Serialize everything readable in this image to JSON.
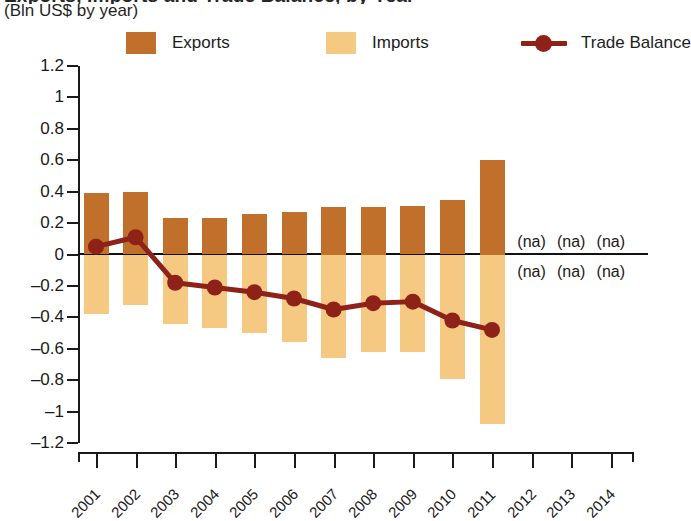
{
  "header": {
    "title": "Exports, Imports and Trade Balance, by Year",
    "subtitle": "(Bln US$ by year)"
  },
  "legend": {
    "items": [
      {
        "label": "Exports",
        "type": "swatch",
        "color": "#C0702A"
      },
      {
        "label": "Imports",
        "type": "swatch",
        "color": "#F6C983"
      },
      {
        "label": "Trade Balance",
        "type": "line-marker",
        "color": "#8E2218"
      }
    ]
  },
  "axes": {
    "y_ticks": [
      "1.2",
      "1",
      "0.8",
      "0.6",
      "0.4",
      "0.2",
      "0",
      "-0.2",
      "-0.4",
      "-0.6",
      "-0.8",
      "-1",
      "-1.2"
    ],
    "y_min": -1.2,
    "y_max": 1.2,
    "x_labels": [
      "2001",
      "2002",
      "2003",
      "2004",
      "2005",
      "2006",
      "2007",
      "2008",
      "2009",
      "2010",
      "2011",
      "2012",
      "2013",
      "2014"
    ]
  },
  "annotations": {
    "na_label": "(na)",
    "na_years": [
      "2012",
      "2013",
      "2014"
    ],
    "na_rows": [
      "exports",
      "imports"
    ]
  },
  "chart_data": {
    "type": "bar",
    "title": "Exports, Imports and Trade Balance, by Year",
    "subtitle": "(Bln US$ by year)",
    "xlabel": "",
    "ylabel": "Bln US$ by year",
    "ylim": [
      -1.2,
      1.2
    ],
    "grid": false,
    "legend_position": "top",
    "categories": [
      "2001",
      "2002",
      "2003",
      "2004",
      "2005",
      "2006",
      "2007",
      "2008",
      "2009",
      "2010",
      "2011",
      "2012",
      "2013",
      "2014"
    ],
    "series": [
      {
        "name": "Exports",
        "type": "bar",
        "color": "#C0702A",
        "values": [
          0.39,
          0.4,
          0.23,
          0.23,
          0.26,
          0.27,
          0.3,
          0.3,
          0.31,
          0.35,
          0.6,
          null,
          null,
          null
        ]
      },
      {
        "name": "Imports",
        "type": "bar",
        "color": "#F6C983",
        "values": [
          -0.38,
          -0.32,
          -0.44,
          -0.47,
          -0.5,
          -0.56,
          -0.66,
          -0.62,
          -0.62,
          -0.79,
          -1.08,
          null,
          null,
          null
        ]
      },
      {
        "name": "Trade Balance",
        "type": "line",
        "color": "#8E2218",
        "values": [
          0.05,
          0.11,
          -0.18,
          -0.21,
          -0.24,
          -0.28,
          -0.35,
          -0.31,
          -0.3,
          -0.42,
          -0.48,
          null,
          null,
          null
        ]
      }
    ]
  }
}
